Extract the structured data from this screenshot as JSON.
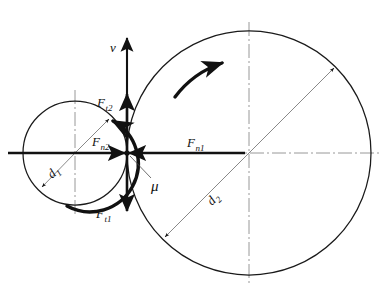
{
  "figure": {
    "background_color": "#ffffff",
    "line_color": "#1a1a1a",
    "thin_line_color": "#6b6b6b",
    "centerline_color": "#8c8c8c"
  },
  "geometry": {
    "contact_point": {
      "x": 127,
      "y": 153
    },
    "wheel_small": {
      "center_x": 75,
      "center_y": 153,
      "radius": 52,
      "name": "wheel-1"
    },
    "wheel_large": {
      "center_x": 249,
      "center_y": 153,
      "radius": 122,
      "name": "wheel-2"
    }
  },
  "labels": {
    "velocity": {
      "base": "v",
      "sub": ""
    },
    "tangential_force_2": {
      "base": "F",
      "sub": "t2"
    },
    "normal_force_2": {
      "base": "F",
      "sub": "n2"
    },
    "tangential_force_1": {
      "base": "F",
      "sub": "t1"
    },
    "normal_force_1": {
      "base": "F",
      "sub": "n1"
    },
    "friction_coefficient": {
      "base": "μ",
      "sub": ""
    },
    "diameter_1": {
      "base": "d",
      "sub": "1"
    },
    "diameter_2": {
      "base": "d",
      "sub": "2"
    }
  },
  "vectors": [
    {
      "id": "velocity-vector",
      "label_key": "velocity",
      "direction": "up",
      "from": {
        "x": 127,
        "y": 153
      },
      "to": {
        "x": 127,
        "y": 36
      },
      "label_pos": {
        "x": 110,
        "y": 48
      }
    },
    {
      "id": "tangential-force-2-vector",
      "label_key": "tangential_force_2",
      "direction": "up",
      "from": {
        "x": 127,
        "y": 153
      },
      "to": {
        "x": 127,
        "y": 92
      },
      "label_pos": {
        "x": 100,
        "y": 103
      }
    },
    {
      "id": "normal-force-2-vector",
      "label_key": "normal_force_2",
      "direction": "right",
      "from": {
        "x": 96,
        "y": 153
      },
      "to": {
        "x": 127,
        "y": 153
      },
      "label_pos": {
        "x": 95,
        "y": 143
      }
    },
    {
      "id": "tangential-force-1-vector",
      "label_key": "tangential_force_1",
      "direction": "down",
      "from": {
        "x": 127,
        "y": 153
      },
      "to": {
        "x": 127,
        "y": 213
      },
      "label_pos": {
        "x": 99,
        "y": 216
      }
    },
    {
      "id": "normal-force-1-vector",
      "label_key": "normal_force_1",
      "direction": "left",
      "from": {
        "x": 160,
        "y": 153
      },
      "to": {
        "x": 127,
        "y": 153
      },
      "label_pos": {
        "x": 190,
        "y": 144
      }
    }
  ],
  "annotations": [
    {
      "id": "friction-coefficient-leader",
      "label_key": "friction_coefficient",
      "label_pos": {
        "x": 154,
        "y": 188
      },
      "leader_from": {
        "x": 129,
        "y": 156
      },
      "leader_to": {
        "x": 152,
        "y": 180
      }
    },
    {
      "id": "diameter-1-dimension",
      "label_key": "diameter_1",
      "label_pos": {
        "x": 56,
        "y": 176
      },
      "rotation_deg": -42,
      "leader_from": {
        "x": 75,
        "y": 153
      },
      "leader_to": {
        "x": 39,
        "y": 190
      }
    },
    {
      "id": "diameter-2-dimension",
      "label_key": "diameter_2",
      "label_pos": {
        "x": 216,
        "y": 204
      },
      "rotation_deg": -46,
      "leader_from": {
        "x": 335,
        "y": 67
      },
      "leader_to": {
        "x": 164,
        "y": 239
      }
    }
  ],
  "rotation_arrows": [
    {
      "id": "wheel-1-rotation-arrow",
      "wheel": "wheel-1",
      "sense": "counterclockwise",
      "note": "arc on the right side of the small wheel sweeping upward toward the contact point"
    },
    {
      "id": "wheel-2-rotation-arrow",
      "wheel": "wheel-2",
      "sense": "clockwise",
      "note": "arc on the upper left of the large wheel sweeping to the upper right"
    }
  ],
  "centerlines": [
    {
      "id": "horizontal-centerline",
      "orientation": "horizontal",
      "y": 153
    },
    {
      "id": "wheel-1-vertical-centerline",
      "orientation": "vertical",
      "x": 75
    },
    {
      "id": "wheel-2-vertical-centerline",
      "orientation": "vertical",
      "x": 249
    }
  ]
}
